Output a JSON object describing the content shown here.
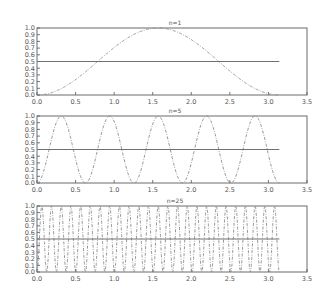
{
  "chart_data": [
    {
      "type": "line",
      "title": "n=1",
      "xlabel": "",
      "ylabel": "",
      "xlim": [
        0.0,
        3.5
      ],
      "ylim": [
        0.0,
        1.0
      ],
      "xticks": [
        "0.0",
        "0.5",
        "1.0",
        "1.5",
        "2.0",
        "2.5",
        "3.0",
        "3.5"
      ],
      "yticks": [
        "0.0",
        "0.1",
        "0.2",
        "0.3",
        "0.4",
        "0.5",
        "0.6",
        "0.7",
        "0.8",
        "0.9",
        "1.0"
      ],
      "grid": false,
      "series": [
        {
          "name": "sin^2(n x)",
          "function": "sin^2",
          "n": 1,
          "x_range": [
            0,
            3.14159
          ],
          "style": "dash-dot"
        },
        {
          "name": "mean",
          "type": "hline",
          "y": 0.5,
          "x_range": [
            0,
            3.14159
          ],
          "style": "solid"
        }
      ]
    },
    {
      "type": "line",
      "title": "n=5",
      "xlabel": "",
      "ylabel": "",
      "xlim": [
        0.0,
        3.5
      ],
      "ylim": [
        0.0,
        1.0
      ],
      "xticks": [
        "0.0",
        "0.5",
        "1.0",
        "1.5",
        "2.0",
        "2.5",
        "3.0",
        "3.5"
      ],
      "yticks": [
        "0.0",
        "0.1",
        "0.2",
        "0.3",
        "0.4",
        "0.5",
        "0.6",
        "0.7",
        "0.8",
        "0.9",
        "1.0"
      ],
      "grid": false,
      "series": [
        {
          "name": "sin^2(n x)",
          "function": "sin^2",
          "n": 5,
          "x_range": [
            0,
            3.14159
          ],
          "style": "dash-dot"
        },
        {
          "name": "mean",
          "type": "hline",
          "y": 0.5,
          "x_range": [
            0,
            3.14159
          ],
          "style": "solid"
        }
      ]
    },
    {
      "type": "line",
      "title": "n=25",
      "xlabel": "",
      "ylabel": "",
      "xlim": [
        0.0,
        3.5
      ],
      "ylim": [
        0.0,
        1.0
      ],
      "xticks": [
        "0.0",
        "0.5",
        "1.0",
        "1.5",
        "2.0",
        "2.5",
        "3.0",
        "3.5"
      ],
      "yticks": [
        "0.0",
        "0.1",
        "0.2",
        "0.3",
        "0.4",
        "0.5",
        "0.6",
        "0.7",
        "0.8",
        "0.9",
        "1.0"
      ],
      "grid": false,
      "series": [
        {
          "name": "sin^2(n x)",
          "function": "sin^2",
          "n": 25,
          "x_range": [
            0,
            3.14159
          ],
          "style": "dash-dot"
        },
        {
          "name": "mean",
          "type": "hline",
          "y": 0.5,
          "x_range": [
            0,
            3.14159
          ],
          "style": "solid"
        }
      ]
    }
  ]
}
